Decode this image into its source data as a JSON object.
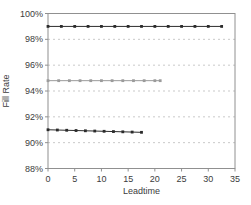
{
  "chart_data": {
    "type": "line",
    "title": "",
    "xlabel": "Leadtime",
    "ylabel": "Fill Rate",
    "xlim": [
      0,
      35
    ],
    "ylim": [
      88,
      100
    ],
    "grid": "horizontal-dashed",
    "legend": "none",
    "colors": {
      "frame": "#909090",
      "gridline": "#c9c9c9",
      "tick_text": "#3c3c3c"
    },
    "x_ticks": [
      {
        "value": 0,
        "label": "0"
      },
      {
        "value": 5,
        "label": "5"
      },
      {
        "value": 10,
        "label": "10"
      },
      {
        "value": 15,
        "label": "15"
      },
      {
        "value": 20,
        "label": "20"
      },
      {
        "value": 25,
        "label": "25"
      },
      {
        "value": 30,
        "label": "30"
      },
      {
        "value": 35,
        "label": "35"
      }
    ],
    "y_ticks": [
      {
        "value": 88,
        "label": "88%"
      },
      {
        "value": 90,
        "label": "90%"
      },
      {
        "value": 92,
        "label": "92%"
      },
      {
        "value": 94,
        "label": "94%"
      },
      {
        "value": 96,
        "label": "96%"
      },
      {
        "value": 98,
        "label": "98%"
      },
      {
        "value": 100,
        "label": "100%"
      }
    ],
    "series": [
      {
        "name": "fill-rate-high",
        "color": "#2b2b2b",
        "marker": "square",
        "x": [
          0,
          2.5,
          5,
          7.5,
          10,
          12.5,
          15,
          17.5,
          20,
          22.5,
          25,
          27.5,
          30,
          32.5
        ],
        "y": [
          99.0,
          99.0,
          99.0,
          99.0,
          99.0,
          99.0,
          99.0,
          99.0,
          99.0,
          99.0,
          99.0,
          99.0,
          99.0,
          99.0
        ]
      },
      {
        "name": "fill-rate-mid",
        "color": "#9b9b9b",
        "marker": "square",
        "x": [
          0,
          2,
          4,
          6,
          8,
          10,
          12,
          14,
          16,
          18,
          20,
          21
        ],
        "y": [
          94.8,
          94.8,
          94.8,
          94.8,
          94.8,
          94.8,
          94.8,
          94.8,
          94.8,
          94.8,
          94.8,
          94.8
        ]
      },
      {
        "name": "fill-rate-low",
        "color": "#2b2b2b",
        "marker": "square",
        "x": [
          0,
          1.75,
          3.5,
          5.25,
          7,
          8.75,
          10.5,
          12.25,
          14,
          15.75,
          17.5
        ],
        "y": [
          91.0,
          90.98,
          90.96,
          90.94,
          90.92,
          90.9,
          90.88,
          90.86,
          90.84,
          90.82,
          90.8
        ]
      }
    ]
  }
}
